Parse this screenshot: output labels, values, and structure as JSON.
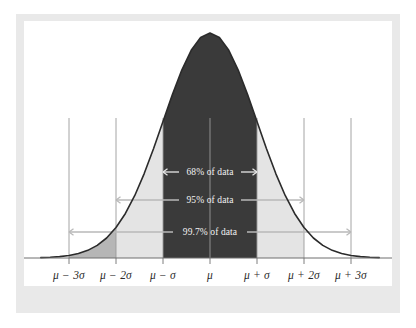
{
  "figure": {
    "kind": "normal-distribution-empirical-rule",
    "background_color": "#ffffff",
    "frame_color": "#e9e9e9",
    "panel_color": "#ffffff"
  },
  "chart_data": {
    "type": "area",
    "title": "",
    "subtitle": "",
    "xlabel": "",
    "ylabel": "",
    "grid": true,
    "legend_position": "none",
    "distribution": "normal",
    "mean_label": "μ",
    "sigma_label": "σ",
    "x_tick_positions_sigma": [
      -3,
      -2,
      -1,
      0,
      1,
      2,
      3
    ],
    "tick_labels": [
      "μ − 3σ",
      "μ − 2σ",
      "μ − σ",
      "μ",
      "μ + σ",
      "μ + 2σ",
      "μ + 3σ"
    ],
    "x": [
      -3.6,
      -3.4,
      -3.2,
      -3.0,
      -2.8,
      -2.6,
      -2.4,
      -2.2,
      -2.0,
      -1.8,
      -1.6,
      -1.4,
      -1.2,
      -1.0,
      -0.8,
      -0.6,
      -0.4,
      -0.2,
      0.0,
      0.2,
      0.4,
      0.6,
      0.8,
      1.0,
      1.2,
      1.4,
      1.6,
      1.8,
      2.0,
      2.2,
      2.4,
      2.6,
      2.8,
      3.0,
      3.2,
      3.4,
      3.6
    ],
    "y": [
      0.0015,
      0.0031,
      0.0061,
      0.0111,
      0.0198,
      0.034,
      0.0561,
      0.0889,
      0.1353,
      0.1979,
      0.278,
      0.3752,
      0.4868,
      0.6065,
      0.7261,
      0.8353,
      0.9231,
      0.9802,
      1.0,
      0.9802,
      0.9231,
      0.8353,
      0.7261,
      0.6065,
      0.4868,
      0.3752,
      0.278,
      0.1979,
      0.1353,
      0.0889,
      0.0561,
      0.034,
      0.0198,
      0.0111,
      0.0061,
      0.0031,
      0.0015
    ],
    "ylim": [
      0,
      1.05
    ],
    "xlim": [
      -3.7,
      3.7
    ],
    "curve_color": "#2b2b2b",
    "regions": [
      {
        "name": "one-sigma-core",
        "from_sigma": -1,
        "to_sigma": 1,
        "color": "#3a3a3a",
        "percent": "68%"
      },
      {
        "name": "two-sigma-left",
        "from_sigma": -2,
        "to_sigma": -1,
        "color": "#e4e4e4"
      },
      {
        "name": "two-sigma-right",
        "from_sigma": 1,
        "to_sigma": 2,
        "color": "#e4e4e4"
      },
      {
        "name": "three-sigma-left-tail",
        "from_sigma": -3,
        "to_sigma": -2,
        "color": "#b6b6b6"
      }
    ],
    "annotations": [
      {
        "name": "68-percent-span",
        "text": "68% of data",
        "from_sigma": -1,
        "to_sigma": 1,
        "text_color": "#f2f2f2",
        "arrow_color": "#e8e8e8"
      },
      {
        "name": "95-percent-span",
        "text": "95% of data",
        "from_sigma": -2,
        "to_sigma": 2,
        "text_color": "#f2f2f2",
        "arrow_color": "#b9b9b9"
      },
      {
        "name": "99.7-percent-span",
        "text": "99.7% of data",
        "from_sigma": -3,
        "to_sigma": 3,
        "text_color": "#f2f2f2",
        "arrow_color": "#b9b9b9"
      }
    ]
  }
}
